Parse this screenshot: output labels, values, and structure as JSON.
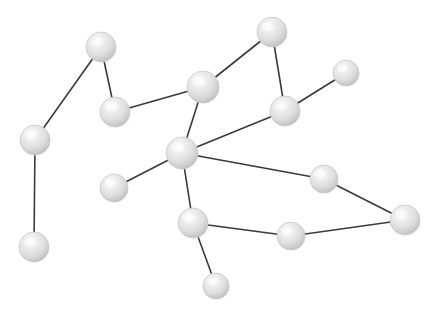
{
  "figure": {
    "width": 437,
    "height": 322,
    "background_color": "#ffffff"
  },
  "style": {
    "node_fill_light": "#f2f2f2",
    "node_fill_mid": "#dcdcdc",
    "node_fill_dark": "#b8b8b8",
    "node_edge_color": "#c9c9c9",
    "node_shadow_color": "#c8c8c8",
    "edge_color": "#3a3a3a",
    "edge_width": 1.6
  },
  "chart_data": {
    "type": "scatter",
    "title": "",
    "xlabel": "",
    "ylabel": "",
    "xlim": [
      0,
      437
    ],
    "ylim": [
      0,
      322
    ],
    "grid": false,
    "legend": "none",
    "node_count": 15,
    "edge_count": 16,
    "nodes": [
      {
        "id": "n1",
        "label": "top-left",
        "x": 101,
        "y": 47,
        "r": 15,
        "degree": 2
      },
      {
        "id": "n2",
        "label": "left-upper",
        "x": 35,
        "y": 140,
        "r": 15,
        "degree": 2
      },
      {
        "id": "n3",
        "label": "left-lower",
        "x": 34,
        "y": 247,
        "r": 15,
        "degree": 1
      },
      {
        "id": "n4",
        "label": "upper-mid-left",
        "x": 115,
        "y": 112,
        "r": 15,
        "degree": 2
      },
      {
        "id": "n5",
        "label": "upper-center",
        "x": 203,
        "y": 87,
        "r": 16,
        "degree": 3
      },
      {
        "id": "n6",
        "label": "top",
        "x": 272,
        "y": 32,
        "r": 15,
        "degree": 2
      },
      {
        "id": "n7",
        "label": "right-upper",
        "x": 285,
        "y": 111,
        "r": 15,
        "degree": 3
      },
      {
        "id": "n8",
        "label": "far-right-small",
        "x": 346,
        "y": 73,
        "r": 13,
        "degree": 1
      },
      {
        "id": "n9",
        "label": "central-hub",
        "x": 182,
        "y": 153,
        "r": 16,
        "degree": 5
      },
      {
        "id": "n10",
        "label": "left-of-hub",
        "x": 114,
        "y": 188,
        "r": 14,
        "degree": 1
      },
      {
        "id": "n11",
        "label": "below-hub",
        "x": 193,
        "y": 223,
        "r": 15,
        "degree": 3
      },
      {
        "id": "n12",
        "label": "bottom-dangler",
        "x": 216,
        "y": 286,
        "r": 13,
        "degree": 1
      },
      {
        "id": "n13",
        "label": "bottom-right-mid",
        "x": 291,
        "y": 236,
        "r": 14,
        "degree": 2
      },
      {
        "id": "n14",
        "label": "right-mid",
        "x": 324,
        "y": 179,
        "r": 14,
        "degree": 2
      },
      {
        "id": "n15",
        "label": "far-right",
        "x": 405,
        "y": 220,
        "r": 15,
        "degree": 2
      }
    ],
    "edges": [
      {
        "source": "n1",
        "target": "n2"
      },
      {
        "source": "n1",
        "target": "n4"
      },
      {
        "source": "n2",
        "target": "n3"
      },
      {
        "source": "n4",
        "target": "n5"
      },
      {
        "source": "n5",
        "target": "n6"
      },
      {
        "source": "n5",
        "target": "n9"
      },
      {
        "source": "n6",
        "target": "n7"
      },
      {
        "source": "n7",
        "target": "n8"
      },
      {
        "source": "n7",
        "target": "n9"
      },
      {
        "source": "n9",
        "target": "n10"
      },
      {
        "source": "n9",
        "target": "n11"
      },
      {
        "source": "n9",
        "target": "n14"
      },
      {
        "source": "n11",
        "target": "n12"
      },
      {
        "source": "n11",
        "target": "n13"
      },
      {
        "source": "n13",
        "target": "n15"
      },
      {
        "source": "n14",
        "target": "n15"
      }
    ]
  }
}
